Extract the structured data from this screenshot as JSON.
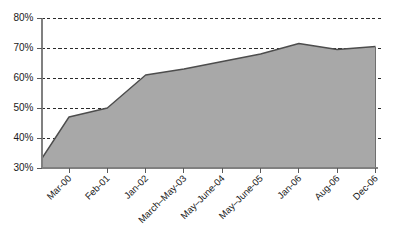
{
  "chart_data": {
    "type": "area",
    "title": "",
    "subtitle": "",
    "xlabel": "",
    "ylabel": "",
    "categories": [
      "Mar-00",
      "Feb-01",
      "Jan-02",
      "March–May-03",
      "May–June-04",
      "May–June-05",
      "Jan-06",
      "Aug-06",
      "Dec-06"
    ],
    "values": [
      47,
      50,
      61,
      63,
      65.5,
      68,
      71.5,
      69.5,
      70.5
    ],
    "origin_value": 33,
    "y_tick_labels": [
      "80%",
      "70%",
      "60%",
      "50%",
      "40%",
      "30%"
    ],
    "y_ticks": [
      80,
      70,
      60,
      50,
      40,
      30
    ],
    "ylim": [
      30,
      80
    ],
    "y_unit": "%",
    "grid": true,
    "grid_axis": "y",
    "legend": false,
    "legend_position": "none",
    "series": [
      {
        "name": "Series 1",
        "values": [
          47,
          50,
          61,
          63,
          65.5,
          68,
          71.5,
          69.5,
          70.5
        ]
      }
    ],
    "annotations": []
  },
  "colors": {
    "area_fill": "#a8a8a8",
    "area_line": "#4d4d4d",
    "gridline": "#2b2b2b",
    "axis": "#808080",
    "text": "#1a1a1a",
    "background": "#ffffff"
  }
}
